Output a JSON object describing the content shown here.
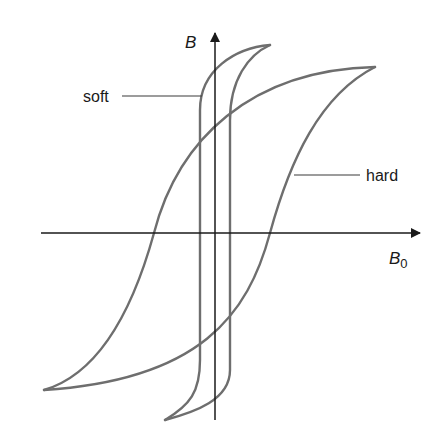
{
  "figure": {
    "axes": {
      "y_label": "B",
      "x_label_main": "B",
      "x_label_sub": "0"
    },
    "annotations": {
      "soft": "soft",
      "hard": "hard"
    },
    "colors": {
      "curve": "#6e6e6e",
      "axis": "#1a1a1a",
      "background": "#ffffff"
    }
  }
}
